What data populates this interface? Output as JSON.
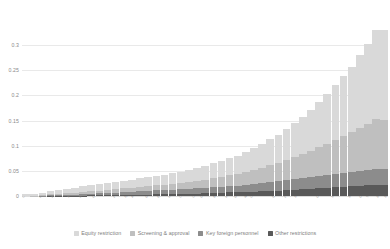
{
  "chart_data": {
    "type": "bar",
    "title": "",
    "subtitle": "",
    "xlabel": "",
    "ylabel": "",
    "stacked": true,
    "grid": true,
    "legend_position": "bottom",
    "ylim": [
      0,
      0.33
    ],
    "yticks": [
      "0",
      "0.05",
      "0.1",
      "0.15",
      "0.2",
      "0.25",
      "0.3"
    ],
    "ytick_values": [
      0,
      0.05,
      0.1,
      0.15,
      0.2,
      0.25,
      0.3
    ],
    "categories": [
      "Luxembourg",
      "Portugal",
      "Netherlands",
      "Slovenia",
      "Romania",
      "Czech Republic",
      "Finland",
      "Spain",
      "Argentina",
      "Germany",
      "Estonia",
      "Hungary",
      "Lithuania",
      "Latvia",
      "Colombia",
      "Belgium",
      "Ireland",
      "Greece",
      "Italy",
      "United Kingdom",
      "Denmark",
      "France",
      "Slovak Republic",
      "Costa Rica",
      "South Africa",
      "Sweden",
      "Chile",
      "Turkey",
      "Japan",
      "Switzerland",
      "Poland",
      "Brazil",
      "Norway",
      "Austria",
      "Peru",
      "United States",
      "Korea",
      "Israel",
      "Australia",
      "Iceland",
      "Mexico",
      "Canada",
      "India",
      "New Zealand",
      "China"
    ],
    "series": [
      {
        "name": "Equity restriction",
        "color": "#d9d9d9",
        "values": [
          0.004,
          0.004,
          0.005,
          0.006,
          0.006,
          0.007,
          0.01,
          0.011,
          0.011,
          0.012,
          0.013,
          0.014,
          0.015,
          0.016,
          0.017,
          0.018,
          0.019,
          0.02,
          0.021,
          0.022,
          0.024,
          0.026,
          0.028,
          0.03,
          0.032,
          0.034,
          0.036,
          0.04,
          0.044,
          0.048,
          0.052,
          0.056,
          0.062,
          0.068,
          0.074,
          0.082,
          0.09,
          0.1,
          0.11,
          0.12,
          0.13,
          0.145,
          0.16,
          0.18,
          0.2
        ]
      },
      {
        "name": "Screening & approval",
        "color": "#bfbfbf",
        "values": [
          0.0,
          0.001,
          0.001,
          0.002,
          0.002,
          0.003,
          0.003,
          0.004,
          0.005,
          0.005,
          0.006,
          0.007,
          0.007,
          0.008,
          0.009,
          0.01,
          0.01,
          0.011,
          0.012,
          0.013,
          0.014,
          0.015,
          0.016,
          0.018,
          0.02,
          0.022,
          0.024,
          0.026,
          0.028,
          0.03,
          0.034,
          0.036,
          0.04,
          0.044,
          0.048,
          0.052,
          0.058,
          0.062,
          0.068,
          0.074,
          0.08,
          0.086,
          0.092,
          0.1,
          0.11
        ]
      },
      {
        "name": "Key foreign personnel",
        "color": "#8c8c8c",
        "values": [
          0.0,
          0.0,
          0.001,
          0.001,
          0.002,
          0.002,
          0.002,
          0.003,
          0.003,
          0.004,
          0.004,
          0.004,
          0.005,
          0.005,
          0.006,
          0.006,
          0.007,
          0.007,
          0.008,
          0.008,
          0.009,
          0.01,
          0.01,
          0.011,
          0.012,
          0.012,
          0.013,
          0.014,
          0.015,
          0.016,
          0.018,
          0.019,
          0.02,
          0.021,
          0.022,
          0.023,
          0.024,
          0.025,
          0.026,
          0.027,
          0.028,
          0.029,
          0.03,
          0.032,
          0.034
        ]
      },
      {
        "name": "Other restrictions",
        "color": "#595959",
        "values": [
          0.0,
          0.0,
          0.0,
          0.001,
          0.001,
          0.001,
          0.001,
          0.001,
          0.002,
          0.002,
          0.002,
          0.002,
          0.003,
          0.003,
          0.003,
          0.003,
          0.004,
          0.004,
          0.004,
          0.005,
          0.005,
          0.005,
          0.006,
          0.006,
          0.006,
          0.007,
          0.007,
          0.008,
          0.008,
          0.009,
          0.01,
          0.01,
          0.011,
          0.012,
          0.013,
          0.014,
          0.015,
          0.016,
          0.017,
          0.018,
          0.019,
          0.02,
          0.021,
          0.023,
          0.025
        ]
      }
    ]
  },
  "legend": {
    "items": [
      {
        "label": "Equity restriction",
        "color": "#d9d9d9"
      },
      {
        "label": "Screening & approval",
        "color": "#bfbfbf"
      },
      {
        "label": "Key foreign personnel",
        "color": "#8c8c8c"
      },
      {
        "label": "Other restrictions",
        "color": "#595959"
      }
    ]
  }
}
